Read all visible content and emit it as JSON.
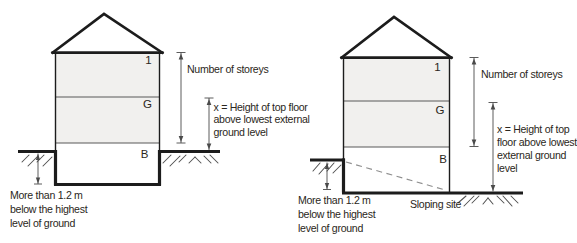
{
  "palette": {
    "line": "#1c1c1c",
    "divider": "#595959",
    "dim": "#4a4a4a",
    "hatch": "#4f4f4f",
    "dash": "#8f8f8f",
    "text": "#2b2721",
    "floor_fill": "#f1f0ee",
    "bg": "#ffffff"
  },
  "left": {
    "floors": {
      "first": "1",
      "ground": "G",
      "basement": "B"
    },
    "storeys_label": "Number of storeys",
    "height_label_lines": [
      "x = Height of top floor",
      "above lowest external",
      "ground level"
    ],
    "depth_label_lines": [
      "More than 1.2 m",
      "below the highest",
      "level of ground"
    ]
  },
  "right": {
    "floors": {
      "first": "1",
      "ground": "G",
      "basement": "B"
    },
    "storeys_label": "Number of storeys",
    "height_label_lines": [
      "x = Height of top",
      "floor above lowest",
      "external ground",
      "level"
    ],
    "depth_label_lines": [
      "More than 1.2 m",
      "below the highest",
      "level of ground"
    ],
    "sloping_site_label": "Sloping site"
  }
}
